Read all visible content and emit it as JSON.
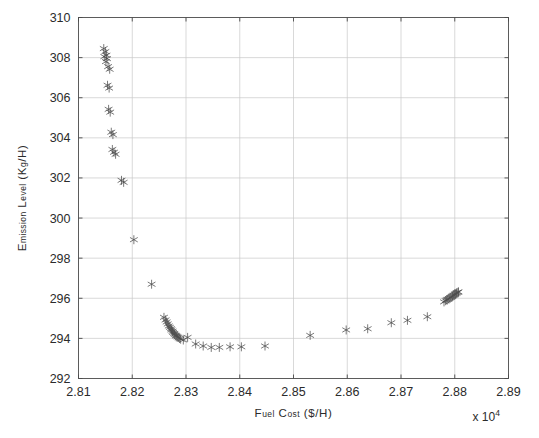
{
  "chart_data": {
    "type": "scatter",
    "title": "",
    "xlabel": "Fuel cost ($/h)",
    "ylabel": "Emission level (kg/h)",
    "x_multiplier": "x 10",
    "x_multiplier_exponent": "4",
    "x_multiplier_value": 10000,
    "xlim": [
      2.81,
      2.89
    ],
    "ylim": [
      292,
      310
    ],
    "xticks": [
      2.81,
      2.82,
      2.83,
      2.84,
      2.85,
      2.86,
      2.87,
      2.88,
      2.89
    ],
    "xtick_labels": [
      "2.81",
      "2.82",
      "2.83",
      "2.84",
      "2.85",
      "2.86",
      "2.87",
      "2.88",
      "2.89"
    ],
    "yticks": [
      292,
      294,
      296,
      298,
      300,
      302,
      304,
      306,
      308,
      310
    ],
    "ytick_labels": [
      "292",
      "294",
      "296",
      "298",
      "300",
      "302",
      "304",
      "306",
      "308",
      "310"
    ],
    "grid": true,
    "legend": "none",
    "marker": "six-pointed-star",
    "marker_color": "#4d4d4d",
    "marker_size": 5,
    "series": [
      {
        "name": "Pareto-optimal solutions",
        "points": [
          [
            2.8147,
            308.45
          ],
          [
            2.815,
            308.3
          ],
          [
            2.8152,
            308.12
          ],
          [
            2.8148,
            308.05
          ],
          [
            2.8153,
            307.95
          ],
          [
            2.8151,
            307.8
          ],
          [
            2.8155,
            307.55
          ],
          [
            2.8158,
            307.42
          ],
          [
            2.8154,
            306.62
          ],
          [
            2.8157,
            306.48
          ],
          [
            2.8156,
            305.42
          ],
          [
            2.8159,
            305.28
          ],
          [
            2.8161,
            304.28
          ],
          [
            2.8164,
            304.16
          ],
          [
            2.8163,
            303.42
          ],
          [
            2.8166,
            303.28
          ],
          [
            2.8169,
            303.18
          ],
          [
            2.818,
            301.88
          ],
          [
            2.8184,
            301.78
          ],
          [
            2.8203,
            298.92
          ],
          [
            2.8236,
            296.7
          ],
          [
            2.8259,
            295.05
          ],
          [
            2.8262,
            294.92
          ],
          [
            2.8264,
            294.82
          ],
          [
            2.8266,
            294.72
          ],
          [
            2.8268,
            294.62
          ],
          [
            2.827,
            294.55
          ],
          [
            2.8272,
            294.48
          ],
          [
            2.8273,
            294.42
          ],
          [
            2.8275,
            294.36
          ],
          [
            2.8276,
            294.3
          ],
          [
            2.8278,
            294.25
          ],
          [
            2.8279,
            294.2
          ],
          [
            2.8281,
            294.15
          ],
          [
            2.8282,
            294.12
          ],
          [
            2.8284,
            294.08
          ],
          [
            2.8286,
            294.04
          ],
          [
            2.8288,
            294.0
          ],
          [
            2.829,
            293.96
          ],
          [
            2.8295,
            293.92
          ],
          [
            2.8303,
            294.05
          ],
          [
            2.8318,
            293.72
          ],
          [
            2.8332,
            293.62
          ],
          [
            2.8347,
            293.55
          ],
          [
            2.8362,
            293.55
          ],
          [
            2.8382,
            293.58
          ],
          [
            2.8403,
            293.58
          ],
          [
            2.8447,
            293.62
          ],
          [
            2.8531,
            294.15
          ],
          [
            2.8598,
            294.42
          ],
          [
            2.8638,
            294.48
          ],
          [
            2.8682,
            294.78
          ],
          [
            2.8712,
            294.9
          ],
          [
            2.8749,
            295.08
          ],
          [
            2.878,
            295.82
          ],
          [
            2.8783,
            295.88
          ],
          [
            2.8785,
            295.92
          ],
          [
            2.8787,
            295.95
          ],
          [
            2.8789,
            295.98
          ],
          [
            2.8791,
            296.02
          ],
          [
            2.8793,
            296.05
          ],
          [
            2.8795,
            296.08
          ],
          [
            2.8796,
            296.12
          ],
          [
            2.8798,
            296.15
          ],
          [
            2.88,
            296.18
          ],
          [
            2.8801,
            296.22
          ],
          [
            2.8803,
            296.25
          ],
          [
            2.8804,
            296.28
          ],
          [
            2.8806,
            296.3
          ],
          [
            2.8807,
            296.32
          ]
        ]
      }
    ]
  }
}
